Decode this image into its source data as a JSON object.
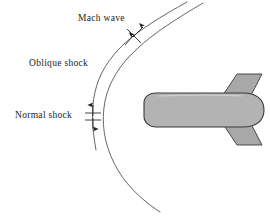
{
  "figure": {
    "name": "supersonic-blunt-body-shock-structure",
    "background_color": "#ffffff"
  },
  "labels": {
    "mach_wave": "Mach wave",
    "oblique_shock": "Oblique shock",
    "normal_shock": "Normal shock"
  },
  "colors": {
    "body_fill": "#b3b3b3",
    "body_outline": "#3a3a3a",
    "fin_fill": "#a8a8a8",
    "shock_line": "#555555",
    "annotation": "#222222",
    "text": "#1a1a1a"
  },
  "annotations": {
    "mach_wave_marker": "double-arrow-perpendicular-tick",
    "normal_shock_marker": "vertical-double-arrow-with-tick",
    "shock_curves": 2
  }
}
